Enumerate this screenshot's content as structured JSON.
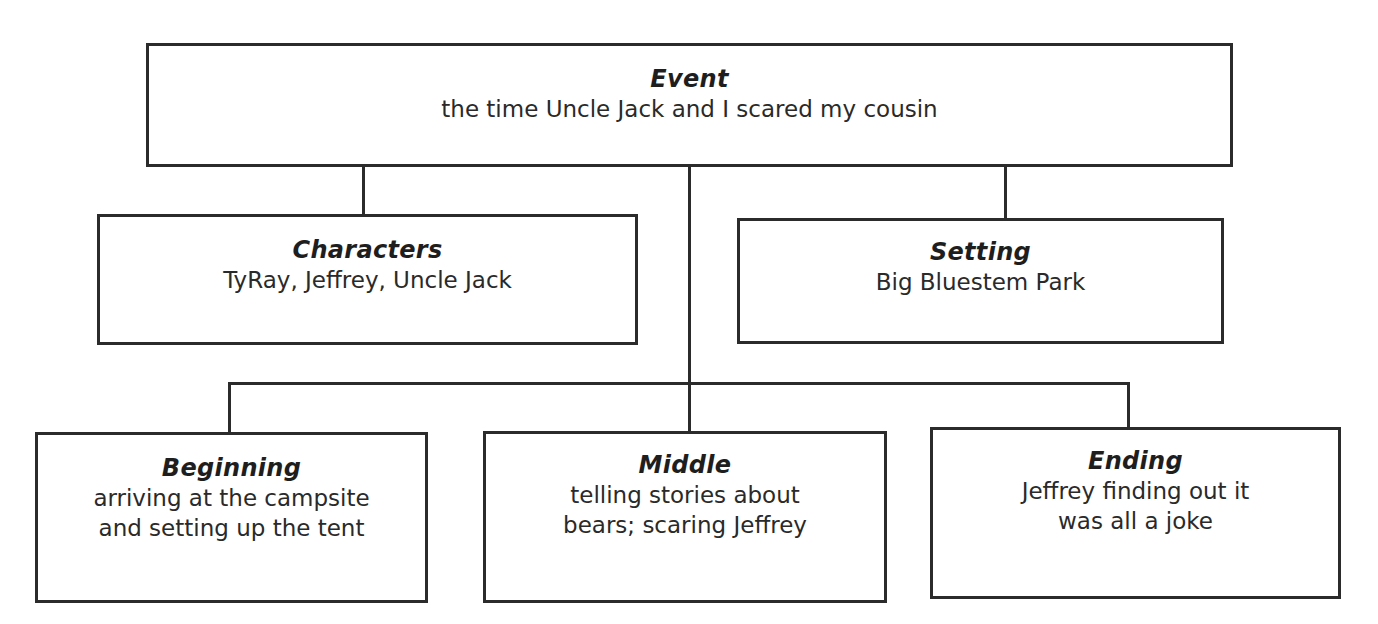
{
  "diagram": {
    "type": "story-map",
    "event": {
      "title": "Event",
      "text": "the time Uncle Jack and I scared my cousin"
    },
    "characters": {
      "title": "Characters",
      "text": "TyRay, Jeffrey, Uncle Jack"
    },
    "setting": {
      "title": "Setting",
      "text": "Big Bluestem Park"
    },
    "beginning": {
      "title": "Beginning",
      "lines": [
        "arriving at the campsite",
        "and setting up the tent"
      ]
    },
    "middle": {
      "title": "Middle",
      "lines": [
        "telling stories about",
        "bears; scaring Jeffrey"
      ]
    },
    "ending": {
      "title": "Ending",
      "lines": [
        "Jeffrey finding out it",
        "was all a joke"
      ]
    },
    "colors": {
      "stroke": "#2b2b2b",
      "background": "#ffffff",
      "text": "#231f20"
    }
  }
}
